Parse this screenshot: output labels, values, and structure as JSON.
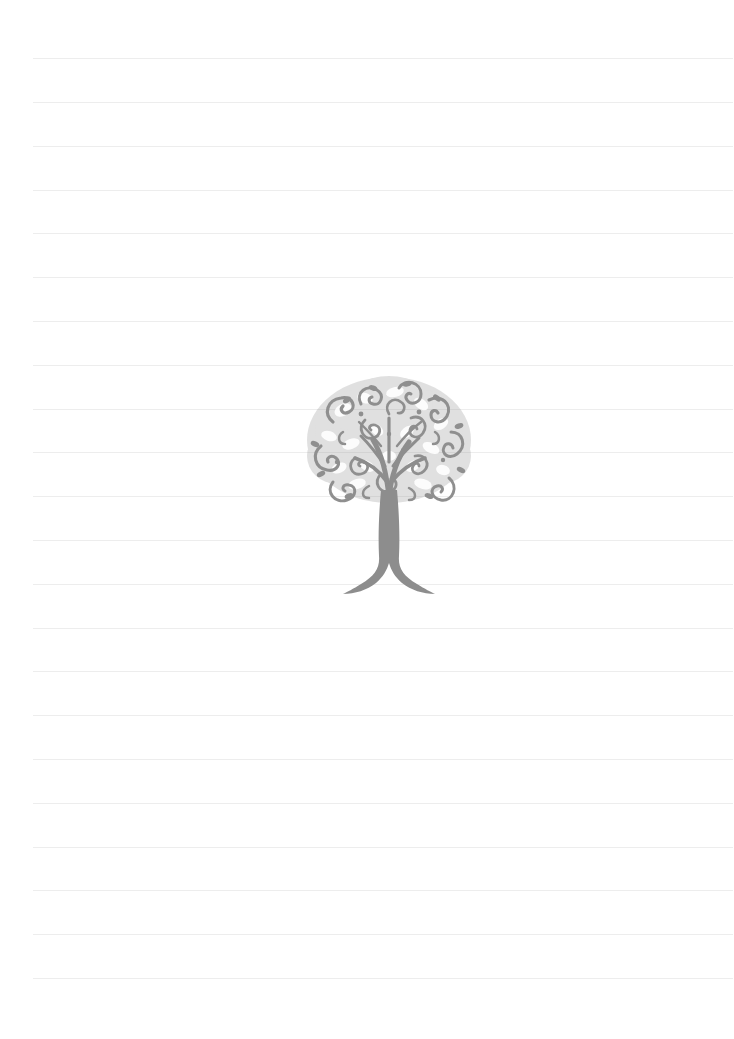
{
  "page": {
    "width": 734,
    "height": 1039,
    "background_color": "#ffffff",
    "orientation": "portrait",
    "paper_style": "ruled"
  },
  "ruling": {
    "name": "horizontal-ruled-lines",
    "line_color": "#ededed",
    "line_thickness_px": 1,
    "line_count": 22,
    "left_margin_px": 33,
    "right_edge_px": 733,
    "first_line_y_px": 58,
    "line_spacing_px": 43.8,
    "line_positions_y": [
      58,
      102,
      146,
      190,
      233,
      277,
      321,
      365,
      409,
      452,
      496,
      540,
      584,
      628,
      671,
      715,
      759,
      803,
      847,
      890,
      934,
      978
    ]
  },
  "illustration": {
    "name": "ornamental-tree",
    "subject": "tree",
    "style": "filigree-silhouette",
    "color": "#909090",
    "canopy_color": "#9a9a9a",
    "trunk_color": "#8d8d8d",
    "left_px": 303,
    "top_px": 370,
    "width_px": 172,
    "height_px": 226,
    "center_x_px": 389,
    "alt_text": "Decorative ornamental tree with swirling filigree foliage and a flared trunk"
  },
  "content": {
    "text_lines": [],
    "has_written_text": false,
    "notes": ""
  }
}
